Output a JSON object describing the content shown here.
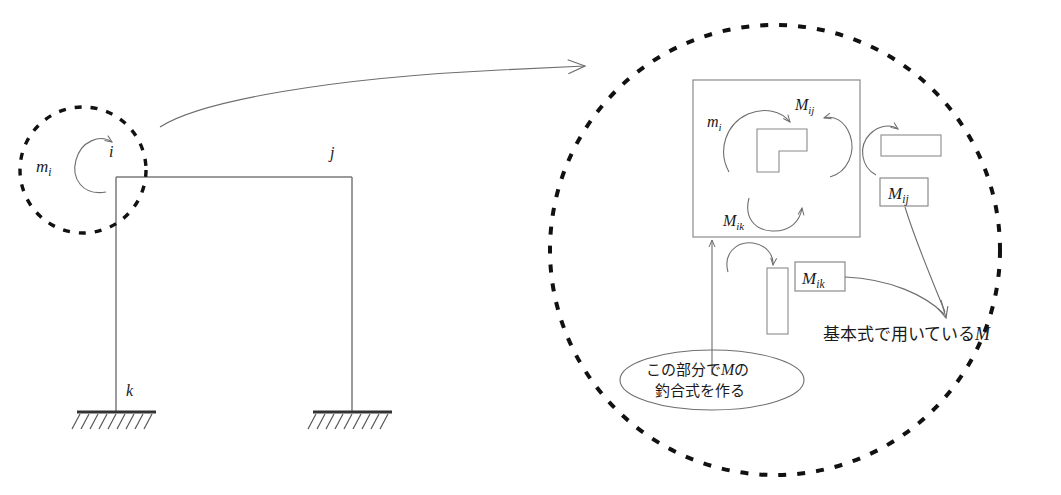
{
  "figure": {
    "background_color": "#ffffff",
    "line_color": "#6e6e6e",
    "dash_color": "#111111"
  },
  "frame": {
    "node_i_label": "i",
    "node_j_label": "j",
    "node_k_label": "k",
    "applied_moment_label": "m",
    "applied_moment_sub": "i",
    "description": "Portal frame with fixed bases, applied joint moment at node i"
  },
  "detail": {
    "joint_moment_label": "m",
    "joint_moment_sub": "i",
    "member_moment_ij_label": "M",
    "member_moment_ij_sub": "ij",
    "member_moment_ik_label": "M",
    "member_moment_ik_sub": "ik",
    "boxed_moment_ij_label": "M",
    "boxed_moment_ij_sub": "ij",
    "boxed_moment_ik_label": "M",
    "boxed_moment_ik_sub": "ik",
    "basic_equation_note_pre": "基本式で用いている",
    "basic_equation_note_symbol": "M",
    "callout_line1_pre": "この部分で",
    "callout_line1_symbol": "M",
    "callout_line1_post": "の",
    "callout_line2": "釣合式を作る"
  }
}
